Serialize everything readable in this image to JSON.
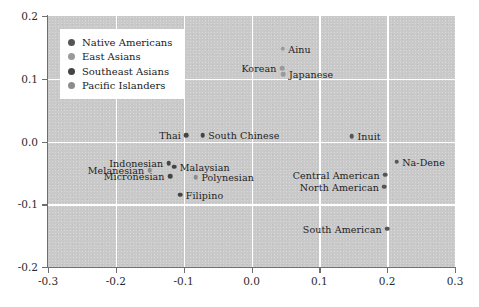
{
  "chart_data": {
    "type": "scatter",
    "title": "",
    "xlabel": "",
    "ylabel": "",
    "xlim": [
      -0.3,
      0.3
    ],
    "ylim": [
      -0.2,
      0.2
    ],
    "grid": true,
    "legend_position": "upper-left",
    "xticks": [
      "-0.3",
      "-0.2",
      "-0.1",
      "0.0",
      "0.1",
      "0.2",
      "0.3"
    ],
    "xtick_values": [
      -0.3,
      -0.2,
      -0.1,
      0.0,
      0.1,
      0.2,
      0.3
    ],
    "yticks": [
      "0.2",
      "0.1",
      "0.0",
      "-0.1",
      "-0.2"
    ],
    "ytick_values": [
      0.2,
      0.1,
      0.0,
      -0.1,
      -0.2
    ],
    "legend": [
      {
        "label": "Native Americans",
        "color": "#555555"
      },
      {
        "label": "East Asians",
        "color": "#9a9a9a"
      },
      {
        "label": "Southeast Asians",
        "color": "#454545"
      },
      {
        "label": "Pacific Islanders",
        "color": "#8c8c8c"
      }
    ],
    "series": [
      {
        "name": "Native Americans",
        "color": "#555555",
        "points": [
          {
            "label": "Inuit",
            "x": 0.148,
            "y": 0.008,
            "label_pos": "right"
          },
          {
            "label": "Na-Dene",
            "x": 0.214,
            "y": -0.032,
            "label_pos": "right"
          },
          {
            "label": "Central American",
            "x": 0.197,
            "y": -0.053,
            "label_pos": "left"
          },
          {
            "label": "North American",
            "x": 0.196,
            "y": -0.072,
            "label_pos": "left"
          },
          {
            "label": "South American",
            "x": 0.2,
            "y": -0.139,
            "label_pos": "left"
          }
        ]
      },
      {
        "name": "East Asians",
        "color": "#9a9a9a",
        "points": [
          {
            "label": "Ainu",
            "x": 0.046,
            "y": 0.148,
            "label_pos": "right"
          },
          {
            "label": "Korean",
            "x": 0.045,
            "y": 0.117,
            "label_pos": "left"
          },
          {
            "label": "Japanese",
            "x": 0.047,
            "y": 0.107,
            "label_pos": "right"
          }
        ]
      },
      {
        "name": "Southeast Asians",
        "color": "#454545",
        "points": [
          {
            "label": "Thai",
            "x": -0.096,
            "y": 0.01,
            "label_pos": "left"
          },
          {
            "label": "South Chinese",
            "x": -0.072,
            "y": 0.01,
            "label_pos": "right"
          },
          {
            "label": "Indonesian",
            "x": -0.122,
            "y": -0.035,
            "label_pos": "left"
          },
          {
            "label": "Malaysian",
            "x": -0.114,
            "y": -0.04,
            "label_pos": "right"
          },
          {
            "label": "Micronesian",
            "x": -0.12,
            "y": -0.055,
            "label_pos": "left"
          },
          {
            "label": "Filipino",
            "x": -0.105,
            "y": -0.085,
            "label_pos": "right"
          }
        ]
      },
      {
        "name": "Pacific Islanders",
        "color": "#8c8c8c",
        "points": [
          {
            "label": "Melanesian",
            "x": -0.15,
            "y": -0.046,
            "label_pos": "left"
          },
          {
            "label": "Polynesian",
            "x": -0.082,
            "y": -0.057,
            "label_pos": "right"
          }
        ]
      }
    ]
  }
}
